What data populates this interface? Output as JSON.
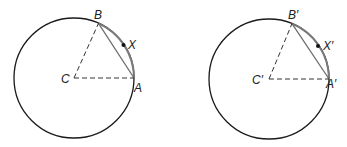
{
  "figures": [
    {
      "center_label": "C",
      "point_a_label": "A",
      "point_b_label": "B",
      "point_x_label": "X"
    },
    {
      "center_label": "C′",
      "point_a_label": "A′",
      "point_b_label": "B′",
      "point_x_label": "X′"
    }
  ],
  "colors": {
    "circle": "#1a1a1a",
    "arc": "#7a7a7a",
    "chord": "#6e6e6e",
    "radius_dashed": "#333333",
    "point": "#111111"
  }
}
